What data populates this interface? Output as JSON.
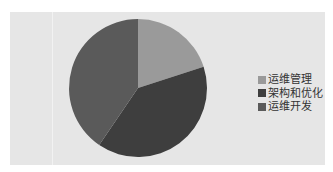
{
  "chart_data": {
    "type": "pie",
    "title": "",
    "categories": [
      "运维管理",
      "架构和优化",
      "运维开发"
    ],
    "values": [
      20,
      39.5,
      40.5
    ],
    "colors": [
      "#9a9a9a",
      "#3e3e3e",
      "#5a5a5a"
    ],
    "legend_position": "right",
    "start_angle": "12 o'clock, clockwise"
  },
  "legend": {
    "items": [
      {
        "label": "运维管理",
        "color": "#9a9a9a"
      },
      {
        "label": "架构和优化",
        "color": "#3e3e3e"
      },
      {
        "label": "运维开发",
        "color": "#5a5a5a"
      }
    ]
  }
}
